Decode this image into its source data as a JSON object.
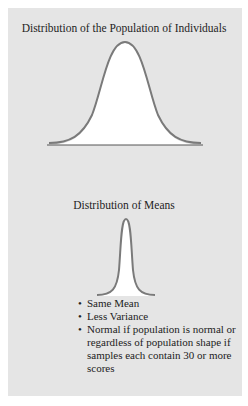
{
  "figure": {
    "population": {
      "title": "Distribution of the Population of Individuals",
      "shape": "wide-normal-curve"
    },
    "means": {
      "title": "Distribution of Means",
      "shape": "narrow-normal-curve"
    },
    "bullets": [
      {
        "marker": "•",
        "text": "Same Mean"
      },
      {
        "marker": "•",
        "text": "Less Variance"
      },
      {
        "marker": "•",
        "text": "Normal if population is normal or regardless of population shape if samples each contain 30 or more scores"
      }
    ]
  },
  "colors": {
    "page_background": "#ffffff",
    "panel_background": "#e5e5e5",
    "curve_fill": "#ffffff",
    "curve_stroke": "#7a7a7a",
    "baseline": "#555555",
    "text": "#222222"
  }
}
